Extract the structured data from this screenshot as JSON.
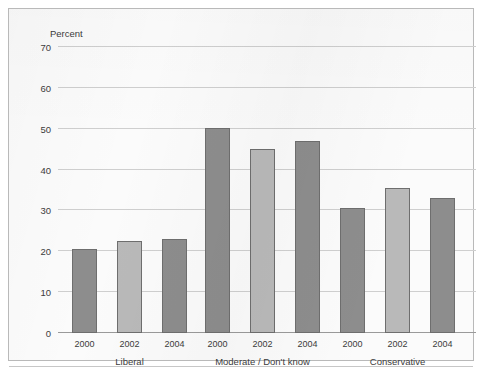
{
  "axis_title": "Percent",
  "colors": {
    "bar_dark": "#8d8d8d",
    "bar_light": "#b9b9b9",
    "bar_outline": "#6e6e6e",
    "gridline": "#cfcfcf",
    "panel_background": "#fbfbfb",
    "panel_border": "#b9b9b9",
    "text": "#3c3c3c"
  },
  "y_ticks": [
    "0",
    "10",
    "20",
    "30",
    "40",
    "50",
    "60",
    "70"
  ],
  "x_tick_labels": [
    "2000",
    "2002",
    "2004",
    "2000",
    "2002",
    "2004",
    "2000",
    "2002",
    "2004"
  ],
  "group_labels": [
    "Liberal",
    "Moderate / Don't know",
    "Conservative"
  ],
  "chart_data": {
    "type": "bar",
    "title": "",
    "xlabel": "",
    "ylabel": "Percent",
    "ylim": [
      0,
      70
    ],
    "y_ticks": [
      0,
      10,
      20,
      30,
      40,
      50,
      60,
      70
    ],
    "grid": true,
    "legend_position": "none",
    "groups": [
      "Liberal",
      "Moderate / Don't know",
      "Conservative"
    ],
    "categories": [
      "2000",
      "2002",
      "2004"
    ],
    "series": [
      {
        "name": "2000",
        "values": [
          20.5,
          50.3,
          30.7
        ],
        "color": "#8d8d8d"
      },
      {
        "name": "2002",
        "values": [
          22.6,
          45.0,
          35.4
        ],
        "color": "#b9b9b9"
      },
      {
        "name": "2004",
        "values": [
          23.1,
          47.1,
          33.0
        ],
        "color": "#8d8d8d"
      }
    ],
    "bars": [
      {
        "group": "Liberal",
        "year": "2000",
        "value": 20.5,
        "shade": "dark"
      },
      {
        "group": "Liberal",
        "year": "2002",
        "value": 22.6,
        "shade": "light"
      },
      {
        "group": "Liberal",
        "year": "2004",
        "value": 23.1,
        "shade": "dark"
      },
      {
        "group": "Moderate / Don't know",
        "year": "2000",
        "value": 50.3,
        "shade": "dark"
      },
      {
        "group": "Moderate / Don't know",
        "year": "2002",
        "value": 45.0,
        "shade": "light"
      },
      {
        "group": "Moderate / Don't know",
        "year": "2004",
        "value": 47.1,
        "shade": "dark"
      },
      {
        "group": "Conservative",
        "year": "2000",
        "value": 30.7,
        "shade": "dark"
      },
      {
        "group": "Conservative",
        "year": "2002",
        "value": 35.4,
        "shade": "light"
      },
      {
        "group": "Conservative",
        "year": "2004",
        "value": 33.0,
        "shade": "dark"
      }
    ]
  }
}
